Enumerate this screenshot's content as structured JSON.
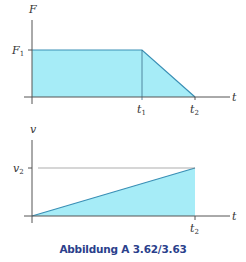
{
  "figure": {
    "caption": "Abbildung A 3.62/3.63",
    "colors": {
      "fill": "#a6ecf7",
      "line": "#3a8fb5",
      "axis": "#555555",
      "caption": "#2b3f8c"
    }
  },
  "top_plot": {
    "y_label": "F",
    "x_label": "t",
    "y_tick": {
      "base": "F",
      "sub": "1"
    },
    "x_ticks": [
      {
        "base": "t",
        "sub": "1"
      },
      {
        "base": "t",
        "sub": "2"
      }
    ]
  },
  "bottom_plot": {
    "y_label": "v",
    "x_label": "t",
    "y_tick": {
      "base": "v",
      "sub": "2"
    },
    "x_ticks": [
      {
        "base": "t",
        "sub": "2"
      }
    ]
  }
}
